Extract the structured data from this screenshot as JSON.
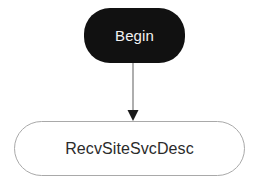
{
  "diagram": {
    "type": "flowchart",
    "orientation": "top-to-bottom",
    "background_color": "#ffffff",
    "nodes": [
      {
        "id": "begin",
        "label": "Begin",
        "shape": "stadium",
        "role": "start-terminal",
        "fill_color": "#111111",
        "text_color": "#f2f2f2",
        "border_color": "#111111"
      },
      {
        "id": "recvsitesvcdesc",
        "label": "RecvSiteSvcDesc",
        "shape": "stadium",
        "role": "process",
        "fill_color": "#ffffff",
        "text_color": "#2b2b2b",
        "border_color": "#a9a9a9"
      }
    ],
    "edges": [
      {
        "id": "begin-to-recvsitesvcdesc",
        "from": "begin",
        "to": "recvsitesvcdesc",
        "label": "",
        "line_color": "#8c8c8c",
        "arrowhead_color": "#1a1a1a",
        "arrowhead": "solid-triangle",
        "direction": "down"
      }
    ]
  }
}
